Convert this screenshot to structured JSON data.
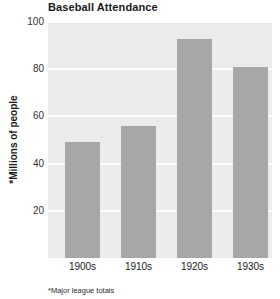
{
  "chart_data": {
    "type": "bar",
    "title": "Baseball Attendance",
    "xlabel": "",
    "ylabel": "*Millions of people",
    "categories": [
      "1900s",
      "1910s",
      "1920s",
      "1930s"
    ],
    "values": [
      49,
      56,
      93,
      81
    ],
    "ylim": [
      0,
      100
    ],
    "yticks": [
      20,
      40,
      60,
      80,
      100
    ],
    "ytick_labels": [
      "20",
      "40",
      "60",
      "80",
      "100"
    ],
    "grid": true,
    "legend": "none",
    "footnote": "*Major league totals",
    "series": [
      {
        "name": "Attendance",
        "values": [
          49,
          56,
          93,
          81
        ]
      }
    ],
    "bar_color": "#a7a7a7",
    "plot_background": "#ebebeb",
    "gridline_color": "#fcfcfc",
    "figure_background": "#ffffff"
  }
}
